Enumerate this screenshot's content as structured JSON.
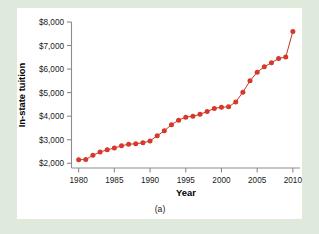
{
  "figure": {
    "caption": "(a)",
    "background_color": "#dfe9dc",
    "panel_color": "#ffffff"
  },
  "chart_data": {
    "type": "line",
    "title": "",
    "subtitle": "",
    "xlabel": "Year",
    "ylabel": "In-state tuition",
    "xlim": [
      1979,
      2011
    ],
    "ylim": [
      1800,
      8000
    ],
    "grid": false,
    "legend": null,
    "marker": "circle",
    "marker_color": "#d8372a",
    "line_color": "#c0392b",
    "x_tick_labels": [
      "1980",
      "1985",
      "1990",
      "1995",
      "2000",
      "2005",
      "2010"
    ],
    "x_ticks": [
      1980,
      1985,
      1990,
      1995,
      2000,
      2005,
      2010
    ],
    "y_tick_labels": [
      "$2,000",
      "$3,000",
      "$4,000",
      "$5,000",
      "$6,000",
      "$7,000",
      "$8,000"
    ],
    "y_ticks": [
      2000,
      3000,
      4000,
      5000,
      6000,
      7000,
      8000
    ],
    "x": [
      1980,
      1981,
      1982,
      1983,
      1984,
      1985,
      1986,
      1987,
      1988,
      1989,
      1990,
      1991,
      1992,
      1993,
      1994,
      1995,
      1996,
      1997,
      1998,
      1999,
      2000,
      2001,
      2002,
      2003,
      2004,
      2005,
      2006,
      2007,
      2008,
      2009,
      2010
    ],
    "values": [
      2150,
      2160,
      2340,
      2480,
      2570,
      2650,
      2740,
      2810,
      2830,
      2870,
      2950,
      3170,
      3380,
      3640,
      3830,
      3960,
      4000,
      4080,
      4200,
      4330,
      4380,
      4400,
      4600,
      5020,
      5500,
      5870,
      6100,
      6270,
      6450,
      6510,
      7600
    ],
    "series": [
      {
        "name": "In-state tuition",
        "values": [
          2150,
          2160,
          2340,
          2480,
          2570,
          2650,
          2740,
          2810,
          2830,
          2870,
          2950,
          3170,
          3380,
          3640,
          3830,
          3960,
          4000,
          4080,
          4200,
          4330,
          4380,
          4400,
          4600,
          5020,
          5500,
          5870,
          6100,
          6270,
          6450,
          6510,
          7600
        ]
      }
    ]
  }
}
